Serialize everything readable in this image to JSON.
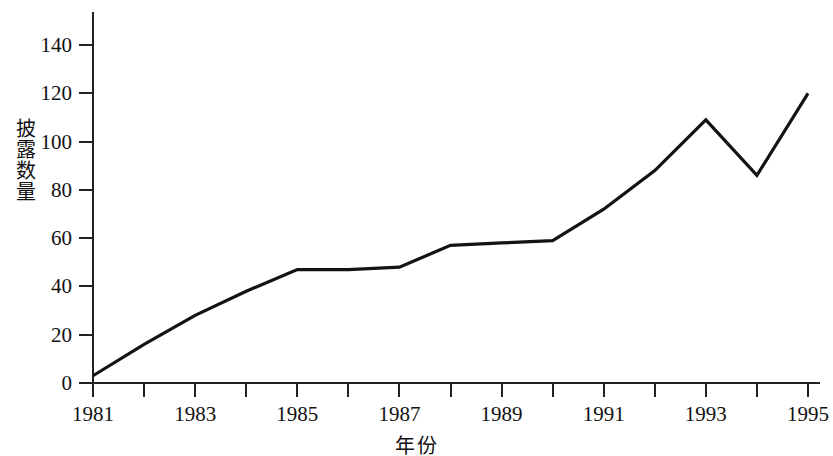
{
  "chart_data": {
    "type": "line",
    "title": "",
    "xlabel": "年份",
    "ylabel": "披露数量",
    "x": [
      1981,
      1982,
      1983,
      1984,
      1985,
      1986,
      1987,
      1988,
      1989,
      1990,
      1991,
      1992,
      1993,
      1994,
      1995
    ],
    "values": [
      3,
      16,
      28,
      38,
      47,
      47,
      48,
      57,
      58,
      59,
      72,
      88,
      109,
      86,
      120
    ],
    "series": [
      {
        "name": "披露数量",
        "values": [
          3,
          16,
          28,
          38,
          47,
          47,
          48,
          57,
          58,
          59,
          72,
          88,
          109,
          86,
          120
        ]
      }
    ],
    "xlim": [
      1981,
      1995
    ],
    "ylim": [
      0,
      148
    ],
    "xticks": [
      1981,
      1982,
      1983,
      1984,
      1985,
      1986,
      1987,
      1988,
      1989,
      1990,
      1991,
      1992,
      1993,
      1994,
      1995
    ],
    "xtick_labels": [
      "1981",
      "",
      "1983",
      "",
      "1985",
      "",
      "1987",
      "",
      "1989",
      "",
      "1991",
      "",
      "1993",
      "",
      "1995"
    ],
    "yticks": [
      0,
      20,
      40,
      60,
      80,
      100,
      120,
      140
    ],
    "ytick_labels": [
      "0",
      "20",
      "40",
      "60",
      "80",
      "100",
      "120",
      "140"
    ],
    "grid": false,
    "legend": null,
    "line_color": "#131313",
    "axis_color": "#222222",
    "background_color": "#ffffff"
  }
}
